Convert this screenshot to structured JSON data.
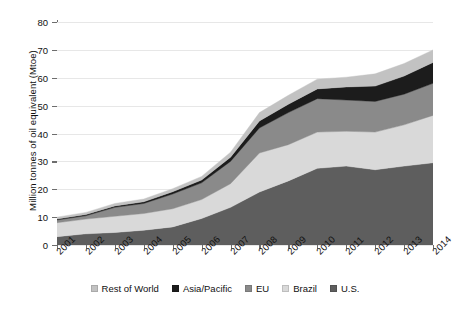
{
  "chart_data": {
    "type": "area",
    "title": "",
    "subtitle": "",
    "xlabel": "",
    "ylabel": "Million tonnes of oil equivalent (Mtoe)",
    "stacked": true,
    "grid": true,
    "legend_position": "bottom",
    "ylim": [
      0,
      80
    ],
    "ytick_step": 10,
    "yticks": [
      "0",
      "10",
      "20",
      "30",
      "40",
      "50",
      "60",
      "70",
      "80"
    ],
    "categories": [
      "2001",
      "2002",
      "2003",
      "2004",
      "2005",
      "2006",
      "2007",
      "2008",
      "2009",
      "2010",
      "2011",
      "2012",
      "2013",
      "2014"
    ],
    "x": [
      "2001",
      "2002",
      "2003",
      "2004",
      "2005",
      "2006",
      "2007",
      "2008",
      "2009",
      "2010",
      "2011",
      "2012",
      "2013",
      "2014"
    ],
    "series": [
      {
        "name": "U.S.",
        "color": "#5e5e5e",
        "values": [
          3.0,
          4.0,
          4.5,
          5.3,
          6.5,
          9.5,
          13.5,
          19.0,
          23.0,
          27.5,
          28.3,
          27.0,
          28.3,
          29.5
        ]
      },
      {
        "name": "Brazil",
        "color": "#d9d9d9",
        "values": [
          5.0,
          5.3,
          5.8,
          6.0,
          6.5,
          6.8,
          8.5,
          14.0,
          13.0,
          13.0,
          12.5,
          13.5,
          14.8,
          17.0
        ]
      },
      {
        "name": "EU",
        "color": "#8a8a8a",
        "values": [
          1.0,
          1.2,
          3.2,
          3.6,
          5.3,
          6.0,
          8.0,
          9.0,
          11.5,
          12.0,
          11.2,
          11.0,
          11.0,
          11.5
        ]
      },
      {
        "name": "Asia/Pacific",
        "color": "#1c1c1c",
        "values": [
          0.3,
          0.4,
          0.5,
          0.6,
          0.8,
          1.0,
          1.5,
          2.5,
          3.0,
          3.5,
          4.7,
          5.5,
          6.5,
          7.5
        ]
      },
      {
        "name": "Rest of World",
        "color": "#c2c2c2",
        "values": [
          0.7,
          0.8,
          0.9,
          1.0,
          1.1,
          1.3,
          1.8,
          3.0,
          3.2,
          3.5,
          3.5,
          4.4,
          4.5,
          4.5
        ]
      }
    ],
    "totals": [
      10.0,
      11.7,
      14.9,
      16.5,
      20.2,
      24.6,
      33.3,
      47.5,
      53.7,
      59.5,
      60.2,
      61.4,
      65.1,
      70.0
    ]
  },
  "legend": {
    "items": [
      {
        "label": "Rest of World",
        "color": "#c2c2c2"
      },
      {
        "label": "Asia/Pacific",
        "color": "#1c1c1c"
      },
      {
        "label": "EU",
        "color": "#8a8a8a"
      },
      {
        "label": "Brazil",
        "color": "#d9d9d9"
      },
      {
        "label": "U.S.",
        "color": "#5e5e5e"
      }
    ]
  },
  "axes": {
    "y_title": "Million tonnes of oil equivalent (Mtoe)",
    "y_labels": [
      "80",
      "70",
      "60",
      "50",
      "40",
      "30",
      "20",
      "10",
      "0"
    ],
    "x_labels": [
      "2001",
      "2002",
      "2003",
      "2004",
      "2005",
      "2006",
      "2007",
      "2008",
      "2009",
      "2010",
      "2011",
      "2012",
      "2013",
      "2014"
    ]
  },
  "colors": {
    "axis": "#6d6d6d",
    "grid": "#e7e7e7",
    "background": "#ffffff",
    "text": "#111111"
  }
}
